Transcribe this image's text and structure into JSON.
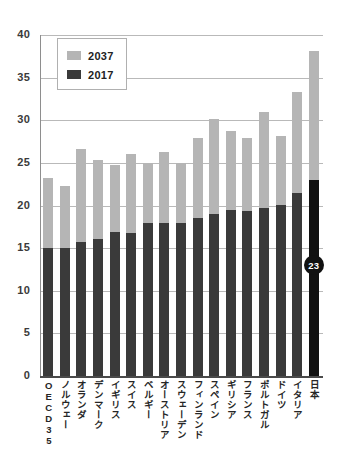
{
  "chart_data": {
    "type": "bar",
    "title": "",
    "subtitle": "",
    "xlabel": "",
    "ylabel": "",
    "ylim": [
      0,
      40
    ],
    "yticks": [
      0,
      5,
      10,
      15,
      20,
      25,
      30,
      35,
      40
    ],
    "grid": true,
    "stacked": true,
    "legend_position": "inside-top-left",
    "categories": [
      "OECD35",
      "ノルウェー",
      "オランダ",
      "デンマーク",
      "イギリス",
      "スイス",
      "ベルギー",
      "オーストリア",
      "スウェーデン",
      "フィンランド",
      "スペイン",
      "ギリシア",
      "フランス",
      "ポルトガル",
      "ドイツ",
      "イタリア",
      "日本"
    ],
    "series": [
      {
        "name": "2037",
        "color": "#b5b5b5",
        "values": [
          23.2,
          22.3,
          26.6,
          25.3,
          24.7,
          26.0,
          25.0,
          26.3,
          25.0,
          27.9,
          30.2,
          28.7,
          27.9,
          31.0,
          28.2,
          33.3,
          38.1
        ]
      },
      {
        "name": "2017",
        "color": "#3a3a3a",
        "values": [
          15.0,
          15.0,
          15.7,
          16.1,
          16.9,
          16.8,
          18.0,
          18.0,
          18.0,
          18.5,
          19.0,
          19.5,
          19.4,
          19.7,
          20.1,
          21.5,
          23.0
        ]
      }
    ],
    "annotations": [
      {
        "name": "japan-2017-callout",
        "label": "23",
        "category": "日本",
        "series": "2017",
        "value": 23,
        "shape": "circle",
        "fill": "#111111",
        "text_color": "#ffffff"
      }
    ]
  },
  "legend": {
    "items": [
      {
        "label": "2037",
        "color": "#b5b5b5"
      },
      {
        "label": "2017",
        "color": "#3a3a3a"
      }
    ]
  },
  "colors": {
    "series_2037": "#b5b5b5",
    "series_2017": "#3a3a3a",
    "highlight": "#111111",
    "gridline": "#b9b9b9",
    "axis": "#4a4a4a",
    "text": "#262626",
    "background": "#ffffff"
  }
}
